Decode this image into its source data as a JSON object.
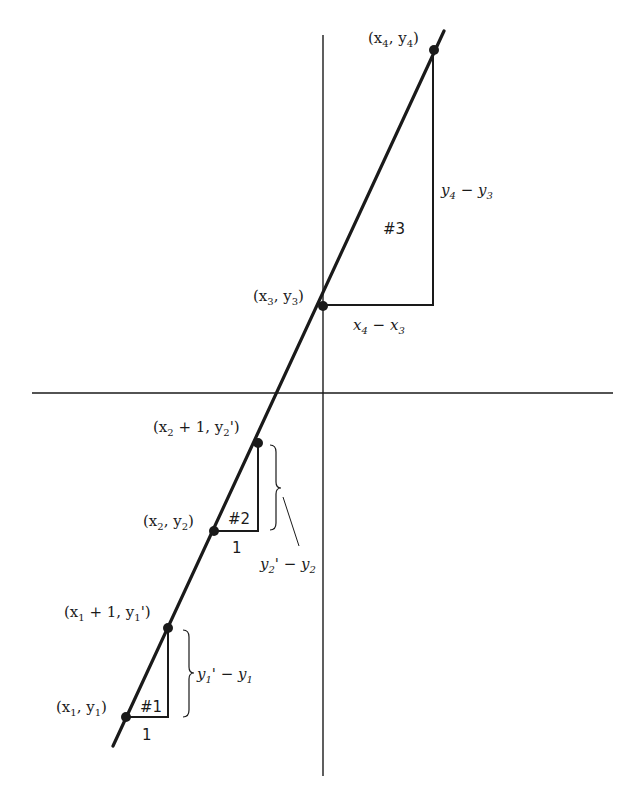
{
  "diagram": {
    "type": "line-slope-triangles",
    "colors": {
      "ink": "#1a1a1a",
      "background": "#ffffff"
    },
    "axes": {
      "horizontal": {
        "y": 393,
        "x1": 32,
        "x2": 613
      },
      "vertical": {
        "x": 323,
        "y1": 35,
        "y2": 776
      }
    },
    "line": {
      "x1": 113,
      "y1": 746,
      "x2": 444,
      "y2": 31
    },
    "points": [
      {
        "id": "p1",
        "x": 126,
        "y": 717,
        "label_base": "(x",
        "label": "(x1, y1)"
      },
      {
        "id": "p1p",
        "x": 168,
        "y": 628,
        "label": "(x1 + 1, y1')"
      },
      {
        "id": "p2",
        "x": 214,
        "y": 531,
        "label": "(x2, y2)"
      },
      {
        "id": "p2p",
        "x": 258,
        "y": 443,
        "label": "(x2 + 1, y2')"
      },
      {
        "id": "p3",
        "x": 323,
        "y": 306,
        "label": "(x3, y3)"
      },
      {
        "id": "p4",
        "x": 434,
        "y": 50,
        "label": "(x4, y4)"
      }
    ],
    "triangles": [
      {
        "id": "tri1",
        "label": "#1",
        "run_label": "1",
        "rise_label": "y1' − y1"
      },
      {
        "id": "tri2",
        "label": "#2",
        "run_label": "1",
        "rise_label": "y2' − y2"
      },
      {
        "id": "tri3",
        "label": "#3",
        "run_label": "x4 − x3",
        "rise_label": "y4 − y3"
      }
    ],
    "text": {
      "p1": {
        "a": "(x",
        "s1": "1",
        "b": ", y",
        "s2": "1",
        "c": ")"
      },
      "p1p": {
        "a": "(x",
        "s1": "1",
        "b": " + 1, y",
        "s2": "1",
        "c": "')"
      },
      "p2": {
        "a": "(x",
        "s1": "2",
        "b": ", y",
        "s2": "2",
        "c": ")"
      },
      "p2p": {
        "a": "(x",
        "s1": "2",
        "b": " + 1, y",
        "s2": "2",
        "c": "')"
      },
      "p3": {
        "a": "(x",
        "s1": "3",
        "b": ", y",
        "s2": "3",
        "c": ")"
      },
      "p4": {
        "a": "(x",
        "s1": "4",
        "b": ", y",
        "s2": "4",
        "c": ")"
      },
      "tri1_label": "#1",
      "tri1_run": "1",
      "tri1_rise": {
        "a": "y",
        "s1": "1",
        "b": "' − y",
        "s2": "1"
      },
      "tri2_label": "#2",
      "tri2_run": "1",
      "tri2_rise": {
        "a": "y",
        "s1": "2",
        "b": "' − y",
        "s2": "2"
      },
      "tri3_label": "#3",
      "tri3_run": {
        "a": "x",
        "s1": "4",
        "b": " − x",
        "s2": "3"
      },
      "tri3_rise": {
        "a": "y",
        "s1": "4",
        "b": " − y",
        "s2": "3"
      }
    }
  }
}
